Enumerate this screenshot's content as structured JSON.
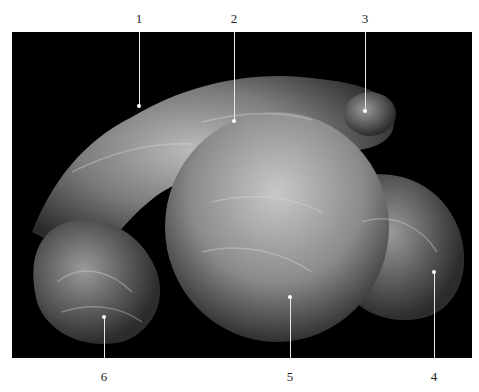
{
  "figure": {
    "background_color": "#000000",
    "labels": [
      {
        "id": "1",
        "text": "1",
        "x": 139,
        "label_y": 12,
        "line_top": 32,
        "line_end": 106,
        "position": "top"
      },
      {
        "id": "2",
        "text": "2",
        "x": 234,
        "label_y": 12,
        "line_top": 32,
        "line_end": 121,
        "position": "top"
      },
      {
        "id": "3",
        "text": "3",
        "x": 365,
        "label_y": 12,
        "line_top": 32,
        "line_end": 111,
        "position": "top"
      },
      {
        "id": "4",
        "text": "4",
        "x": 434,
        "label_y": 370,
        "line_top": 272,
        "line_end": 358,
        "position": "bottom"
      },
      {
        "id": "5",
        "text": "5",
        "x": 290,
        "label_y": 370,
        "line_top": 297,
        "line_end": 358,
        "position": "bottom"
      },
      {
        "id": "6",
        "text": "6",
        "x": 104,
        "label_y": 370,
        "line_top": 317,
        "line_end": 358,
        "position": "bottom"
      }
    ]
  }
}
